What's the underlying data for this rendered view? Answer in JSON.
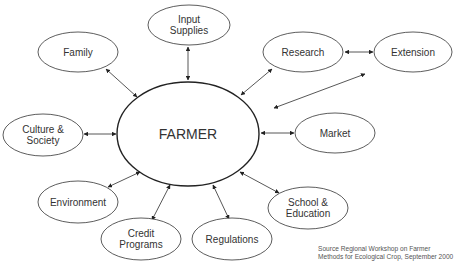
{
  "diagram": {
    "title": "FARMER",
    "center": {
      "label": "FARMER",
      "cx": 188,
      "cy": 134,
      "rx": 71,
      "ry": 52
    },
    "nodes": [
      {
        "id": "input-supplies",
        "lines": [
          "Input",
          "Supplies"
        ],
        "cx": 189,
        "cy": 25,
        "rx": 41,
        "ry": 20
      },
      {
        "id": "family",
        "lines": [
          "Family"
        ],
        "cx": 78,
        "cy": 52,
        "rx": 40,
        "ry": 20
      },
      {
        "id": "research",
        "lines": [
          "Research"
        ],
        "cx": 303,
        "cy": 52,
        "rx": 40,
        "ry": 20
      },
      {
        "id": "extension",
        "lines": [
          "Extension"
        ],
        "cx": 413,
        "cy": 52,
        "rx": 39,
        "ry": 20
      },
      {
        "id": "culture-society",
        "lines": [
          "Culture &",
          "Society"
        ],
        "cx": 43,
        "cy": 135,
        "rx": 40,
        "ry": 21
      },
      {
        "id": "market",
        "lines": [
          "Market"
        ],
        "cx": 335,
        "cy": 133,
        "rx": 40,
        "ry": 20
      },
      {
        "id": "environment",
        "lines": [
          "Environment"
        ],
        "cx": 78,
        "cy": 202,
        "rx": 40,
        "ry": 21
      },
      {
        "id": "school-education",
        "lines": [
          "School &",
          "Education"
        ],
        "cx": 308,
        "cy": 208,
        "rx": 40,
        "ry": 21
      },
      {
        "id": "credit-programs",
        "lines": [
          "Credit",
          "Programs"
        ],
        "cx": 141,
        "cy": 239,
        "rx": 40,
        "ry": 21
      },
      {
        "id": "regulations",
        "lines": [
          "Regulations"
        ],
        "cx": 232,
        "cy": 239,
        "rx": 40,
        "ry": 21
      }
    ],
    "edges": [
      {
        "from": "farmer",
        "to": "input-supplies",
        "x1": 188,
        "y1": 80,
        "x2": 188,
        "y2": 47
      },
      {
        "from": "farmer",
        "to": "family",
        "x1": 137,
        "y1": 97,
        "x2": 106,
        "y2": 69
      },
      {
        "from": "farmer",
        "to": "research",
        "x1": 241,
        "y1": 95,
        "x2": 272,
        "y2": 69
      },
      {
        "from": "research",
        "to": "extension",
        "x1": 345,
        "y1": 52,
        "x2": 373,
        "y2": 52
      },
      {
        "from": "farmer-area",
        "to": "extension",
        "x1": 274,
        "y1": 108,
        "x2": 365,
        "y2": 74
      },
      {
        "from": "farmer",
        "to": "culture-society",
        "x1": 116,
        "y1": 134,
        "x2": 84,
        "y2": 134
      },
      {
        "from": "farmer",
        "to": "market",
        "x1": 261,
        "y1": 133,
        "x2": 294,
        "y2": 133
      },
      {
        "from": "farmer",
        "to": "environment",
        "x1": 140,
        "y1": 172,
        "x2": 108,
        "y2": 187
      },
      {
        "from": "farmer",
        "to": "school-education",
        "x1": 240,
        "y1": 172,
        "x2": 279,
        "y2": 193
      },
      {
        "from": "farmer",
        "to": "credit-programs",
        "x1": 170,
        "y1": 185,
        "x2": 152,
        "y2": 220
      },
      {
        "from": "farmer",
        "to": "regulations",
        "x1": 213,
        "y1": 185,
        "x2": 229,
        "y2": 219
      }
    ],
    "colors": {
      "stroke": "#333333",
      "center_stroke": "#222222",
      "text": "#333333",
      "background": "#ffffff"
    }
  },
  "source": {
    "line1": "Source Regional Workshop on Farmer",
    "line2": "Methods for Ecological Crop, September 2000"
  }
}
